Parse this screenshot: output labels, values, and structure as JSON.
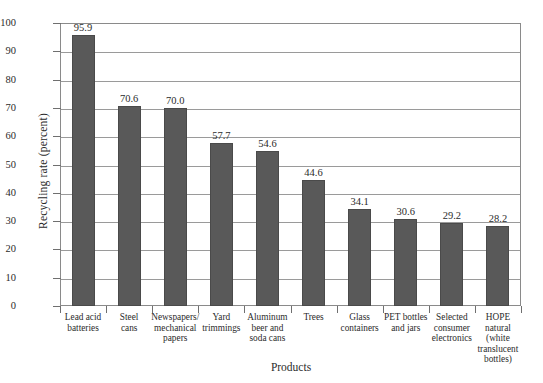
{
  "chart_data": {
    "type": "bar",
    "title": "",
    "xlabel": "Products",
    "ylabel": "Recycling rate (percent)",
    "ylim": [
      0,
      100
    ],
    "ytick_step": 10,
    "yticks": [
      "0",
      "10",
      "20",
      "30",
      "40",
      "50",
      "60",
      "70",
      "80",
      "90",
      "100"
    ],
    "grid": true,
    "legend": "none",
    "bar_color": "#595959",
    "categories": [
      "Lead acid batteries",
      "Steel cans",
      "Newspapers/ mechanical papers",
      "Yard trimmings",
      "Aluminum beer and soda cans",
      "Trees",
      "Glass containers",
      "PET bottles and jars",
      "Selected consumer electronics",
      "HOPE natural (white translucent bottles)"
    ],
    "category_lines": [
      [
        "Lead acid",
        "batteries"
      ],
      [
        "Steel",
        "cans"
      ],
      [
        "Newspapers/",
        "mechanical",
        "papers"
      ],
      [
        "Yard",
        "trimmings"
      ],
      [
        "Aluminum",
        "beer and",
        "soda cans"
      ],
      [
        "Trees"
      ],
      [
        "Glass",
        "containers"
      ],
      [
        "PET bottles",
        "and jars"
      ],
      [
        "Selected",
        "consumer",
        "electronics"
      ],
      [
        "HOPE natural",
        "(white",
        "translucent",
        "bottles)"
      ]
    ],
    "values": [
      95.9,
      70.6,
      70.0,
      57.7,
      54.6,
      44.6,
      34.1,
      30.6,
      29.2,
      28.2
    ],
    "value_labels": [
      "95.9",
      "70.6",
      "70.0",
      "57.7",
      "54.6",
      "44.6",
      "34.1",
      "30.6",
      "29.2",
      "28.2"
    ]
  }
}
